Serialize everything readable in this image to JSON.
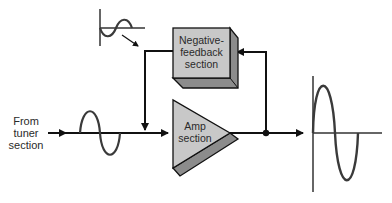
{
  "diagram": {
    "title": "",
    "input_label": {
      "lines": [
        "From",
        "tuner",
        "section"
      ]
    },
    "blocks": {
      "feedback": {
        "lines": [
          "Negative-",
          "feedback",
          "section"
        ]
      },
      "amp": {
        "lines": [
          "Amp",
          "section"
        ]
      }
    },
    "signals": {
      "input_wave": "small sine wave (input)",
      "feedback_wave": "small inverted sine wave (negative feedback)",
      "output_wave": "large amplified sine wave (output)"
    },
    "connections": [
      {
        "from": "tuner",
        "to": "amp",
        "label": ""
      },
      {
        "from": "amp",
        "to": "output",
        "label": ""
      },
      {
        "from": "output-junction",
        "to": "feedback",
        "label": ""
      },
      {
        "from": "feedback",
        "to": "input-junction",
        "label": ""
      }
    ],
    "colors": {
      "line": "#111111",
      "block_face": "#c8c8c8",
      "block_shadow": "#8c8c8c",
      "wave": "#3a3a3a",
      "background": "#ffffff"
    }
  }
}
